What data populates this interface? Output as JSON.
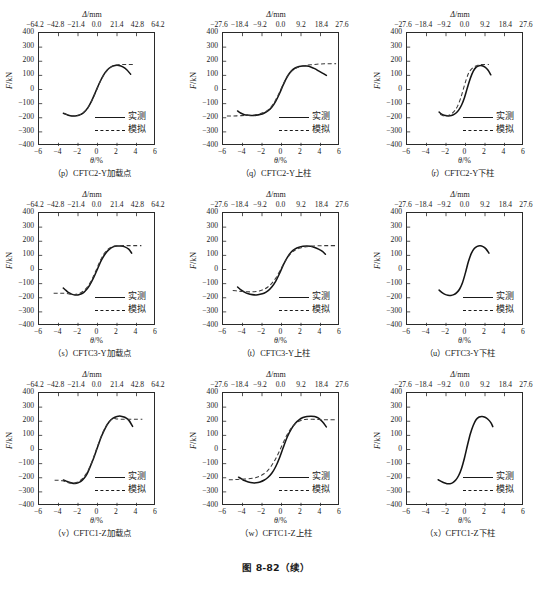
{
  "figure": {
    "caption": "图 8-82（续）",
    "axis": {
      "y_title_symbol": "F",
      "y_title_unit": "/kN",
      "x_title_symbol": "θ",
      "x_title_unit": "/%",
      "secondary_title_symbol": "Δ",
      "secondary_title_unit": "/mm",
      "y_ticks": [
        400,
        300,
        200,
        100,
        0,
        -100,
        -200,
        -300,
        -400
      ],
      "y_tick_labels": [
        "400",
        "300",
        "200",
        "100",
        "0",
        "−100",
        "−200",
        "−300",
        "−400"
      ],
      "x_ticks": [
        -6,
        -4,
        -2,
        0,
        2,
        4,
        6
      ],
      "x_tick_labels": [
        "−6",
        "−4",
        "−2",
        "0",
        "2",
        "4",
        "6"
      ],
      "ylim": [
        -400,
        400
      ],
      "xlim": [
        -6,
        6
      ]
    },
    "legend": {
      "measured_label": "实测",
      "simulated_label": "模拟"
    },
    "secondary_scales": {
      "wide": {
        "labels": [
          "−64.2",
          "−42.8",
          "−21.4",
          "0.0",
          "21.4",
          "42.8",
          "64.2"
        ],
        "values": [
          -64.2,
          -42.8,
          -21.4,
          0.0,
          21.4,
          42.8,
          64.2
        ]
      },
      "narrow": {
        "labels": [
          "−27.6",
          "−18.4",
          "−9.2",
          "0.0",
          "9.2",
          "18.4",
          "27.6"
        ],
        "values": [
          -27.6,
          -18.4,
          -9.2,
          0.0,
          9.2,
          18.4,
          27.6
        ]
      }
    }
  },
  "chart_data": [
    {
      "panel": "p",
      "title": "（p）CFTC2-Y加载点",
      "type": "line",
      "xlabel": "θ/%",
      "ylabel": "F/kN",
      "secondary_xlabel": "Δ/mm",
      "secondary_scale": "wide",
      "xlim": [
        -6,
        6
      ],
      "ylim": [
        -400,
        400
      ],
      "grid": false,
      "legend_position": "lower-right",
      "series": [
        {
          "name": "实测",
          "style": "solid",
          "x": [
            -3.5,
            -3.2,
            -2.9,
            -2.6,
            -2.3,
            -2.0,
            -1.7,
            -1.4,
            -1.0,
            -0.6,
            -0.2,
            0.2,
            0.6,
            1.0,
            1.4,
            1.8,
            2.2,
            2.6,
            3.0,
            3.4
          ],
          "y": [
            -168,
            -176,
            -184,
            -187,
            -187,
            -184,
            -176,
            -162,
            -130,
            -80,
            -18,
            46,
            100,
            138,
            160,
            170,
            170,
            160,
            140,
            108
          ]
        },
        {
          "name": "模拟",
          "style": "dashed",
          "x": [
            -3.4,
            -3.0,
            -2.6,
            -2.2,
            -1.8,
            -1.4,
            -1.0,
            -0.6,
            -0.2,
            0.2,
            0.6,
            1.0,
            1.4,
            1.8,
            2.2,
            2.6,
            3.0,
            3.4,
            3.8
          ],
          "y": [
            -170,
            -182,
            -188,
            -186,
            -178,
            -162,
            -132,
            -82,
            -20,
            44,
            98,
            136,
            160,
            172,
            176,
            177,
            177,
            177,
            177
          ]
        }
      ]
    },
    {
      "panel": "q",
      "title": "（q）CFTC2-Y上柱",
      "type": "line",
      "xlabel": "θ/%",
      "ylabel": "F/kN",
      "secondary_xlabel": "Δ/mm",
      "secondary_scale": "narrow",
      "xlim": [
        -6,
        6
      ],
      "ylim": [
        -400,
        400
      ],
      "grid": false,
      "legend_position": "lower-right",
      "series": [
        {
          "name": "实测",
          "style": "solid",
          "x": [
            -4.5,
            -4.2,
            -3.8,
            -3.4,
            -3.0,
            -2.6,
            -2.2,
            -1.8,
            -1.4,
            -1.0,
            -0.6,
            -0.2,
            0.2,
            0.6,
            1.0,
            1.4,
            1.8,
            2.2,
            2.6,
            3.0,
            3.4,
            3.8,
            4.2,
            4.6
          ],
          "y": [
            -152,
            -166,
            -178,
            -182,
            -184,
            -182,
            -177,
            -168,
            -152,
            -126,
            -84,
            -28,
            36,
            92,
            130,
            152,
            163,
            167,
            166,
            160,
            148,
            132,
            116,
            100
          ]
        },
        {
          "name": "模拟",
          "style": "dashed",
          "x": [
            -5.6,
            -5.0,
            -4.4,
            -3.8,
            -3.2,
            -2.6,
            -2.2,
            -1.8,
            -1.4,
            -1.0,
            -0.6,
            -0.2,
            0.2,
            0.6,
            1.0,
            1.4,
            1.8,
            2.2,
            2.6,
            3.2,
            3.8,
            4.4,
            5.0,
            5.6
          ],
          "y": [
            -188,
            -188,
            -186,
            -184,
            -182,
            -178,
            -172,
            -162,
            -146,
            -118,
            -74,
            -20,
            40,
            92,
            128,
            148,
            160,
            168,
            172,
            176,
            180,
            182,
            183,
            183
          ]
        }
      ]
    },
    {
      "panel": "r",
      "title": "（r）CFTC2-Y下柱",
      "type": "line",
      "xlabel": "θ/%",
      "ylabel": "F/kN",
      "secondary_xlabel": "Δ/mm",
      "secondary_scale": "narrow",
      "xlim": [
        -6,
        6
      ],
      "ylim": [
        -400,
        400
      ],
      "grid": false,
      "legend_position": "lower-right",
      "series": [
        {
          "name": "实测",
          "style": "solid",
          "x": [
            -2.7,
            -2.5,
            -2.2,
            -1.9,
            -1.6,
            -1.3,
            -1.0,
            -0.7,
            -0.4,
            -0.1,
            0.2,
            0.5,
            0.8,
            1.1,
            1.4,
            1.7,
            2.0,
            2.3,
            2.6
          ],
          "y": [
            -160,
            -172,
            -182,
            -186,
            -186,
            -180,
            -168,
            -146,
            -110,
            -56,
            14,
            80,
            130,
            158,
            168,
            168,
            158,
            138,
            104
          ]
        },
        {
          "name": "模拟",
          "style": "dashed",
          "x": [
            -2.6,
            -2.3,
            -2.0,
            -1.7,
            -1.4,
            -1.1,
            -0.8,
            -0.5,
            -0.2,
            0.1,
            0.4,
            0.8,
            1.2,
            1.6,
            2.0,
            2.4
          ],
          "y": [
            -175,
            -186,
            -188,
            -182,
            -170,
            -150,
            -116,
            -62,
            8,
            76,
            126,
            156,
            170,
            176,
            177,
            177
          ]
        }
      ]
    },
    {
      "panel": "s",
      "title": "（s）CFTC3-Y加载点",
      "type": "line",
      "xlabel": "θ/%",
      "ylabel": "F/kN",
      "secondary_xlabel": "Δ/mm",
      "secondary_scale": "wide",
      "xlim": [
        -6,
        6
      ],
      "ylim": [
        -400,
        400
      ],
      "grid": false,
      "legend_position": "lower-right",
      "series": [
        {
          "name": "实测",
          "style": "solid",
          "x": [
            -3.5,
            -3.2,
            -2.9,
            -2.6,
            -2.3,
            -2.0,
            -1.7,
            -1.4,
            -1.1,
            -0.8,
            -0.4,
            0.0,
            0.4,
            0.8,
            1.2,
            1.6,
            2.0,
            2.4,
            2.8,
            3.2,
            3.5
          ],
          "y": [
            -132,
            -150,
            -166,
            -176,
            -180,
            -180,
            -174,
            -162,
            -140,
            -110,
            -58,
            4,
            66,
            112,
            142,
            160,
            166,
            166,
            160,
            144,
            116
          ]
        },
        {
          "name": "模拟",
          "style": "dashed",
          "x": [
            -4.5,
            -4.0,
            -3.5,
            -3.0,
            -2.6,
            -2.2,
            -1.8,
            -1.4,
            -1.0,
            -0.6,
            -0.2,
            0.2,
            0.6,
            1.0,
            1.4,
            1.8,
            2.2,
            2.6,
            3.0,
            3.5,
            4.0,
            4.5
          ],
          "y": [
            -168,
            -168,
            -168,
            -172,
            -178,
            -176,
            -168,
            -150,
            -120,
            -74,
            -14,
            50,
            104,
            138,
            158,
            166,
            168,
            169,
            169,
            169,
            169,
            169
          ]
        }
      ]
    },
    {
      "panel": "t",
      "title": "（t）CFTC3-Y上柱",
      "type": "line",
      "xlabel": "θ/%",
      "ylabel": "F/kN",
      "secondary_xlabel": "Δ/mm",
      "secondary_scale": "narrow",
      "xlim": [
        -6,
        6
      ],
      "ylim": [
        -400,
        400
      ],
      "grid": false,
      "legend_position": "lower-right",
      "series": [
        {
          "name": "实测",
          "style": "solid",
          "x": [
            -4.5,
            -4.2,
            -3.8,
            -3.4,
            -3.0,
            -2.6,
            -2.2,
            -1.8,
            -1.4,
            -1.0,
            -0.6,
            -0.2,
            0.2,
            0.6,
            1.0,
            1.4,
            1.8,
            2.2,
            2.6,
            3.0,
            3.4,
            3.8,
            4.2,
            4.5
          ],
          "y": [
            -124,
            -142,
            -160,
            -172,
            -178,
            -180,
            -176,
            -168,
            -152,
            -124,
            -84,
            -28,
            34,
            86,
            124,
            146,
            158,
            164,
            166,
            164,
            156,
            144,
            128,
            108
          ]
        },
        {
          "name": "模拟",
          "style": "dashed",
          "x": [
            -5.0,
            -4.5,
            -4.0,
            -3.5,
            -3.0,
            -2.6,
            -2.2,
            -1.8,
            -1.4,
            -1.0,
            -0.6,
            -0.2,
            0.2,
            0.6,
            1.0,
            1.4,
            1.8,
            2.2,
            2.6,
            3.2,
            3.8,
            4.4,
            5.0,
            5.6
          ],
          "y": [
            -148,
            -152,
            -156,
            -158,
            -158,
            -156,
            -150,
            -140,
            -124,
            -98,
            -62,
            -14,
            38,
            82,
            116,
            138,
            150,
            158,
            162,
            166,
            168,
            169,
            169,
            169
          ]
        }
      ]
    },
    {
      "panel": "u",
      "title": "（u）CFTC3-Y下柱",
      "type": "line",
      "xlabel": "θ/%",
      "ylabel": "F/kN",
      "secondary_xlabel": "Δ/mm",
      "secondary_scale": "narrow",
      "xlim": [
        -6,
        6
      ],
      "ylim": [
        -400,
        400
      ],
      "grid": false,
      "legend_position": "lower-right",
      "series": [
        {
          "name": "实测",
          "style": "solid",
          "x": [
            -2.7,
            -2.4,
            -2.1,
            -1.8,
            -1.5,
            -1.2,
            -0.9,
            -0.6,
            -0.3,
            0.0,
            0.3,
            0.6,
            0.9,
            1.2,
            1.5,
            1.8,
            2.1,
            2.4
          ],
          "y": [
            -146,
            -164,
            -176,
            -182,
            -184,
            -178,
            -164,
            -138,
            -92,
            -22,
            56,
            114,
            148,
            164,
            168,
            162,
            146,
            116
          ]
        }
      ]
    },
    {
      "panel": "v",
      "title": "（v）CFTC1-Z加载点",
      "type": "line",
      "xlabel": "θ/%",
      "ylabel": "F/kN",
      "secondary_xlabel": "Δ/mm",
      "secondary_scale": "wide",
      "xlim": [
        -6,
        6
      ],
      "ylim": [
        -400,
        400
      ],
      "grid": false,
      "legend_position": "lower-right",
      "series": [
        {
          "name": "实测",
          "style": "solid",
          "x": [
            -3.5,
            -3.2,
            -2.9,
            -2.6,
            -2.3,
            -2.0,
            -1.7,
            -1.4,
            -1.1,
            -0.8,
            -0.4,
            0.0,
            0.4,
            0.8,
            1.2,
            1.6,
            2.0,
            2.4,
            2.8,
            3.2,
            3.6
          ],
          "y": [
            -216,
            -224,
            -232,
            -238,
            -240,
            -236,
            -226,
            -206,
            -176,
            -130,
            -62,
            16,
            92,
            152,
            196,
            222,
            234,
            236,
            228,
            208,
            164
          ]
        },
        {
          "name": "模拟",
          "style": "dashed",
          "x": [
            -4.4,
            -4.0,
            -3.6,
            -3.2,
            -2.8,
            -2.4,
            -2.0,
            -1.6,
            -1.2,
            -0.8,
            -0.4,
            0.0,
            0.4,
            0.8,
            1.2,
            1.6,
            2.0,
            2.4,
            2.8,
            3.4,
            4.0,
            4.6
          ],
          "y": [
            -218,
            -218,
            -222,
            -230,
            -238,
            -238,
            -230,
            -210,
            -176,
            -126,
            -56,
            22,
            96,
            156,
            198,
            220,
            216,
            214,
            214,
            214,
            214,
            214
          ]
        }
      ]
    },
    {
      "panel": "w",
      "title": "（w）CFTC1-Z上柱",
      "type": "line",
      "xlabel": "θ/%",
      "ylabel": "F/kN",
      "secondary_xlabel": "Δ/mm",
      "secondary_scale": "narrow",
      "xlim": [
        -6,
        6
      ],
      "ylim": [
        -400,
        400
      ],
      "grid": false,
      "legend_position": "lower-right",
      "series": [
        {
          "name": "实测",
          "style": "solid",
          "x": [
            -4.4,
            -4.1,
            -3.8,
            -3.4,
            -3.0,
            -2.6,
            -2.2,
            -1.8,
            -1.4,
            -1.0,
            -0.6,
            -0.2,
            0.2,
            0.6,
            1.0,
            1.4,
            1.8,
            2.2,
            2.6,
            3.0,
            3.4,
            3.8,
            4.2,
            4.6
          ],
          "y": [
            -196,
            -208,
            -220,
            -230,
            -236,
            -236,
            -230,
            -218,
            -198,
            -168,
            -122,
            -58,
            18,
            90,
            144,
            184,
            210,
            226,
            234,
            236,
            234,
            222,
            196,
            160
          ]
        },
        {
          "name": "模拟",
          "style": "dashed",
          "x": [
            -5.4,
            -5.0,
            -4.5,
            -4.0,
            -3.5,
            -3.0,
            -2.6,
            -2.2,
            -1.8,
            -1.4,
            -1.0,
            -0.6,
            -0.2,
            0.2,
            0.6,
            1.0,
            1.4,
            1.8,
            2.2,
            2.6,
            3.2,
            3.8,
            4.4,
            5.0,
            5.6
          ],
          "y": [
            -214,
            -214,
            -212,
            -210,
            -208,
            -204,
            -198,
            -188,
            -172,
            -148,
            -112,
            -66,
            -10,
            52,
            108,
            152,
            182,
            200,
            210,
            214,
            214,
            212,
            211,
            211,
            211
          ]
        }
      ]
    },
    {
      "panel": "x",
      "title": "（x）CFTC1-Z下柱",
      "type": "line",
      "xlabel": "θ/%",
      "ylabel": "F/kN",
      "secondary_xlabel": "Δ/mm",
      "secondary_scale": "narrow",
      "xlim": [
        -6,
        6
      ],
      "ylim": [
        -400,
        400
      ],
      "grid": false,
      "legend_position": "lower-right",
      "series": [
        {
          "name": "实测",
          "style": "solid",
          "x": [
            -2.8,
            -2.5,
            -2.2,
            -1.9,
            -1.6,
            -1.3,
            -1.0,
            -0.7,
            -0.4,
            -0.1,
            0.2,
            0.5,
            0.8,
            1.1,
            1.4,
            1.7,
            2.0,
            2.3,
            2.6,
            2.8
          ],
          "y": [
            -214,
            -226,
            -236,
            -242,
            -242,
            -234,
            -216,
            -184,
            -132,
            -58,
            30,
            112,
            172,
            212,
            230,
            234,
            228,
            214,
            190,
            162
          ]
        }
      ]
    }
  ]
}
